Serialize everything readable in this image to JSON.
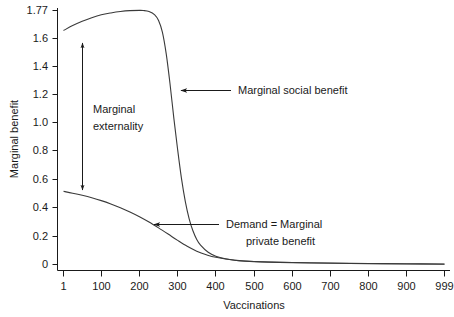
{
  "chart_data": {
    "type": "line",
    "title": "",
    "xlabel": "Vaccinations",
    "ylabel": "Marginal benefit",
    "xlim": [
      1,
      999
    ],
    "ylim": [
      0,
      1.77
    ],
    "grid": false,
    "legend": "none (inline annotations)",
    "x_ticks": [
      "1",
      "100",
      "200",
      "300",
      "400",
      "500",
      "600",
      "700",
      "800",
      "900",
      "999"
    ],
    "x_tick_values": [
      1,
      100,
      200,
      300,
      400,
      500,
      600,
      700,
      800,
      900,
      999
    ],
    "y_ticks": [
      "0",
      "0.2",
      "0.4",
      "0.6",
      "0.8",
      "1.0",
      "1.2",
      "1.4",
      "1.6",
      "1.77"
    ],
    "y_tick_values": [
      0,
      0.2,
      0.4,
      0.6,
      0.8,
      1.0,
      1.2,
      1.4,
      1.6,
      1.77
    ],
    "series": [
      {
        "name": "Marginal social benefit",
        "x": [
          1,
          25,
          50,
          75,
          100,
          125,
          150,
          175,
          200,
          210,
          225,
          240,
          250,
          260,
          270,
          280,
          290,
          300,
          310,
          320,
          330,
          340,
          350,
          360,
          380,
          400,
          425,
          450,
          500,
          600,
          700,
          800,
          900,
          999
        ],
        "values": [
          1.63,
          1.665,
          1.695,
          1.72,
          1.74,
          1.753,
          1.763,
          1.769,
          1.771,
          1.77,
          1.763,
          1.74,
          1.7,
          1.62,
          1.47,
          1.26,
          1.02,
          0.8,
          0.6,
          0.44,
          0.32,
          0.235,
          0.175,
          0.135,
          0.085,
          0.058,
          0.04,
          0.03,
          0.02,
          0.013,
          0.009,
          0.006,
          0.004,
          0.002
        ]
      },
      {
        "name": "Demand = Marginal private benefit",
        "x": [
          1,
          25,
          50,
          75,
          100,
          125,
          150,
          175,
          200,
          225,
          250,
          275,
          300,
          325,
          350,
          375,
          400,
          450,
          500,
          600,
          700,
          800,
          900,
          999
        ],
        "values": [
          0.51,
          0.497,
          0.482,
          0.465,
          0.445,
          0.422,
          0.396,
          0.366,
          0.333,
          0.296,
          0.255,
          0.212,
          0.168,
          0.127,
          0.093,
          0.068,
          0.05,
          0.03,
          0.021,
          0.014,
          0.01,
          0.007,
          0.005,
          0.003
        ]
      }
    ],
    "annotations": [
      {
        "id": "marginal-social-benefit",
        "text": "Marginal social benefit",
        "arrow": "left"
      },
      {
        "id": "demand-marginal-private-benefit",
        "text_line1": "Demand = Marginal",
        "text_line2": "private benefit",
        "arrow": "left"
      },
      {
        "id": "marginal-externality",
        "text_line1": "Marginal",
        "text_line2": "externality",
        "arrow": "double-vertical",
        "from_value": 0.51,
        "to_value": 1.63
      }
    ],
    "colors": {
      "curve": "#3a3a3a",
      "axis": "#1a1a1a",
      "text": "#1a1a1a",
      "background": "#ffffff"
    }
  }
}
